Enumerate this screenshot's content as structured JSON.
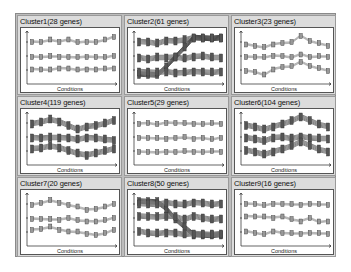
{
  "chart_data": [
    {
      "type": "line",
      "title": "Cluster1(28 genes)",
      "xlabel": "Conditions",
      "ylabel": "",
      "n_conditions": 10,
      "series": [
        {
          "name": "profile-1",
          "values": [
            0.8,
            0.8,
            0.85,
            0.8,
            0.85,
            0.8,
            0.8,
            0.8,
            0.85,
            0.9
          ]
        },
        {
          "name": "profile-2",
          "values": [
            0.5,
            0.5,
            0.52,
            0.5,
            0.5,
            0.5,
            0.5,
            0.5,
            0.5,
            0.52
          ]
        },
        {
          "name": "profile-3",
          "values": [
            0.25,
            0.25,
            0.25,
            0.27,
            0.27,
            0.25,
            0.25,
            0.25,
            0.27,
            0.27
          ]
        }
      ]
    },
    {
      "type": "line",
      "title": "Cluster2(61 genes)",
      "xlabel": "Conditions",
      "ylabel": "",
      "n_conditions": 10,
      "series": [
        {
          "name": "profile-1",
          "values": [
            0.8,
            0.8,
            0.78,
            0.82,
            0.82,
            0.85,
            0.88,
            0.88,
            0.88,
            0.88
          ]
        },
        {
          "name": "profile-2",
          "values": [
            0.48,
            0.46,
            0.5,
            0.48,
            0.5,
            0.48,
            0.5,
            0.52,
            0.5,
            0.48
          ]
        },
        {
          "name": "profile-3",
          "values": [
            0.15,
            0.15,
            0.15,
            0.3,
            0.5,
            0.7,
            0.88,
            0.88,
            0.88,
            0.88
          ]
        },
        {
          "name": "profile-4",
          "values": [
            0.2,
            0.2,
            0.2,
            0.2,
            0.18,
            0.2,
            0.2,
            0.2,
            0.2,
            0.2
          ]
        }
      ]
    },
    {
      "type": "line",
      "title": "Cluster3(23 genes)",
      "xlabel": "Conditions",
      "ylabel": "",
      "n_conditions": 10,
      "series": [
        {
          "name": "profile-1",
          "values": [
            0.75,
            0.72,
            0.7,
            0.75,
            0.78,
            0.8,
            0.92,
            0.82,
            0.78,
            0.72
          ]
        },
        {
          "name": "profile-2",
          "values": [
            0.5,
            0.5,
            0.5,
            0.52,
            0.52,
            0.5,
            0.55,
            0.5,
            0.52,
            0.5
          ]
        },
        {
          "name": "profile-3",
          "values": [
            0.22,
            0.2,
            0.15,
            0.25,
            0.3,
            0.32,
            0.4,
            0.32,
            0.28,
            0.22
          ]
        }
      ]
    },
    {
      "type": "line",
      "title": "Cluster4(119 genes)",
      "xlabel": "Conditions",
      "ylabel": "",
      "n_conditions": 10,
      "series": [
        {
          "name": "profile-1",
          "values": [
            0.78,
            0.82,
            0.88,
            0.82,
            0.75,
            0.68,
            0.72,
            0.75,
            0.8,
            0.85
          ]
        },
        {
          "name": "profile-2",
          "values": [
            0.5,
            0.5,
            0.52,
            0.5,
            0.5,
            0.48,
            0.5,
            0.5,
            0.48,
            0.45
          ]
        },
        {
          "name": "profile-3",
          "values": [
            0.28,
            0.3,
            0.35,
            0.3,
            0.25,
            0.2,
            0.15,
            0.2,
            0.25,
            0.28
          ]
        }
      ]
    },
    {
      "type": "line",
      "title": "Cluster5(29 genes)",
      "xlabel": "Conditions",
      "ylabel": "",
      "n_conditions": 10,
      "series": [
        {
          "name": "profile-1",
          "values": [
            0.78,
            0.8,
            0.78,
            0.8,
            0.8,
            0.8,
            0.78,
            0.78,
            0.8,
            0.78
          ]
        },
        {
          "name": "profile-2",
          "values": [
            0.5,
            0.5,
            0.5,
            0.48,
            0.5,
            0.52,
            0.48,
            0.5,
            0.48,
            0.5
          ]
        },
        {
          "name": "profile-3",
          "values": [
            0.22,
            0.22,
            0.22,
            0.22,
            0.22,
            0.24,
            0.22,
            0.22,
            0.24,
            0.22
          ]
        }
      ]
    },
    {
      "type": "line",
      "title": "Cluster6(104 genes)",
      "xlabel": "Conditions",
      "ylabel": "",
      "n_conditions": 10,
      "series": [
        {
          "name": "profile-1",
          "values": [
            0.75,
            0.72,
            0.68,
            0.72,
            0.78,
            0.85,
            0.92,
            0.85,
            0.78,
            0.72
          ]
        },
        {
          "name": "profile-2",
          "values": [
            0.5,
            0.48,
            0.45,
            0.5,
            0.52,
            0.5,
            0.52,
            0.5,
            0.5,
            0.48
          ]
        },
        {
          "name": "profile-3",
          "values": [
            0.25,
            0.22,
            0.18,
            0.22,
            0.28,
            0.35,
            0.42,
            0.35,
            0.28,
            0.22
          ]
        }
      ]
    },
    {
      "type": "line",
      "title": "Cluster7(20 genes)",
      "xlabel": "Conditions",
      "ylabel": "",
      "n_conditions": 10,
      "series": [
        {
          "name": "profile-1",
          "values": [
            0.78,
            0.82,
            0.88,
            0.82,
            0.78,
            0.75,
            0.68,
            0.7,
            0.75,
            0.8
          ]
        },
        {
          "name": "profile-2",
          "values": [
            0.5,
            0.5,
            0.5,
            0.48,
            0.52,
            0.48,
            0.45,
            0.45,
            0.48,
            0.52
          ]
        },
        {
          "name": "profile-3",
          "values": [
            0.28,
            0.3,
            0.35,
            0.28,
            0.25,
            0.25,
            0.2,
            0.18,
            0.22,
            0.28
          ]
        }
      ]
    },
    {
      "type": "line",
      "title": "Cluster8(50 genes)",
      "xlabel": "Conditions",
      "ylabel": "",
      "n_conditions": 10,
      "series": [
        {
          "name": "profile-1",
          "values": [
            0.85,
            0.85,
            0.85,
            0.7,
            0.5,
            0.35,
            0.18,
            0.18,
            0.18,
            0.18
          ]
        },
        {
          "name": "profile-2",
          "values": [
            0.8,
            0.8,
            0.8,
            0.82,
            0.8,
            0.8,
            0.82,
            0.82,
            0.8,
            0.8
          ]
        },
        {
          "name": "profile-3",
          "values": [
            0.55,
            0.55,
            0.55,
            0.55,
            0.55,
            0.5,
            0.55,
            0.52,
            0.5,
            0.5
          ]
        },
        {
          "name": "profile-4",
          "values": [
            0.25,
            0.22,
            0.22,
            0.22,
            0.22,
            0.2,
            0.2,
            0.2,
            0.2,
            0.2
          ]
        }
      ]
    },
    {
      "type": "line",
      "title": "Cluster9(16 genes)",
      "xlabel": "Conditions",
      "ylabel": "",
      "n_conditions": 10,
      "series": [
        {
          "name": "profile-1",
          "values": [
            0.8,
            0.8,
            0.78,
            0.8,
            0.8,
            0.8,
            0.78,
            0.8,
            0.8,
            0.78
          ]
        },
        {
          "name": "profile-2",
          "values": [
            0.55,
            0.55,
            0.55,
            0.52,
            0.55,
            0.5,
            0.45,
            0.52,
            0.45,
            0.45
          ]
        },
        {
          "name": "profile-3",
          "values": [
            0.25,
            0.22,
            0.2,
            0.25,
            0.22,
            0.22,
            0.2,
            0.22,
            0.22,
            0.2
          ]
        }
      ]
    }
  ],
  "panels": [
    {
      "title": "Cluster1(28 genes)",
      "xlabel": "Conditions"
    },
    {
      "title": "Cluster2(61 genes)",
      "xlabel": "Conditions"
    },
    {
      "title": "Cluster3(23 genes)",
      "xlabel": "Conditions"
    },
    {
      "title": "Cluster4(119 genes)",
      "xlabel": "Conditions"
    },
    {
      "title": "Cluster5(29 genes)",
      "xlabel": "Conditions"
    },
    {
      "title": "Cluster6(104 genes)",
      "xlabel": "Conditions"
    },
    {
      "title": "Cluster7(20 genes)",
      "xlabel": "Conditions"
    },
    {
      "title": "Cluster8(50 genes)",
      "xlabel": "Conditions"
    },
    {
      "title": "Cluster9(16 genes)",
      "xlabel": "Conditions"
    }
  ],
  "colors": {
    "panel_bg": "#dcdcdc",
    "grid_bg": "#bdbdbd",
    "line": "#555555",
    "marker": "#333333"
  }
}
